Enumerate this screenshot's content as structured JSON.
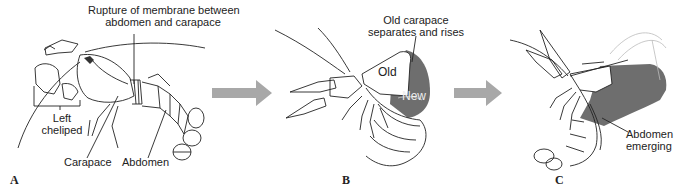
{
  "figure": {
    "panels": [
      {
        "letter": "A",
        "stage": "Intact crayfish before molt",
        "labels": {
          "rupture": "Rupture of membrane between abdomen and carapace",
          "rupture_line1": "Rupture of membrane between",
          "rupture_line2": "abdomen and carapace",
          "cheliped_line1": "Left",
          "cheliped_line2": "cheliped",
          "carapace": "Carapace",
          "abdomen": "Abdomen"
        }
      },
      {
        "letter": "B",
        "stage": "Old carapace lifting off",
        "labels": {
          "old_carapace_line1": "Old carapace",
          "old_carapace_line2": "separates and rises",
          "old": "Old",
          "new": "New"
        }
      },
      {
        "letter": "C",
        "stage": "Abdomen withdrawing from old exoskeleton",
        "labels": {
          "abdomen_emerging_line1": "Abdomen",
          "abdomen_emerging_line2": "emerging"
        }
      }
    ],
    "arrows": [
      {
        "from": "A",
        "to": "B",
        "color": "#a8a8a8"
      },
      {
        "from": "B",
        "to": "C",
        "color": "#a8a8a8"
      }
    ],
    "colors": {
      "line": "#222222",
      "new_exoskeleton": "#6e6e6e",
      "arrow": "#a8a8a8",
      "background": "#ffffff"
    }
  }
}
